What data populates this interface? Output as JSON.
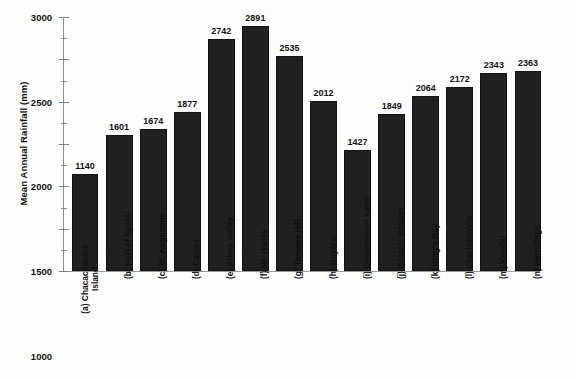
{
  "chart_data": {
    "type": "bar",
    "title": "",
    "xlabel": "",
    "ylabel": "Mean Annual Rainfall (mm)",
    "ylim": [
      0,
      3000
    ],
    "ytick_step": 500,
    "yminor_step": 250,
    "grid": false,
    "legend": "none",
    "yticks": [
      "0",
      "500",
      "1000",
      "1500",
      "2000",
      "2500",
      "3000"
    ],
    "categories": [
      "(a) Chacachacare Island",
      "(b) Port of Spain",
      "(c) St. Augustine",
      "(d) Caroni",
      "(e) Arima Valley",
      "(f) Mt. Harris",
      "(g) Tamana Hill",
      "(h) Mayaro",
      "(i) Government Farm",
      "(j) Botanic Station",
      "(k) King's Bay",
      "(l) Charlotteville",
      "(m) Kendal",
      "(n) Hermitage"
    ],
    "category_lines": [
      [
        "(a) Chacachacare",
        "Island"
      ],
      [
        "(b) Port of Spain"
      ],
      [
        "(c) St. Augustine"
      ],
      [
        "(d) Caroni"
      ],
      [
        "(e) Arima Valley"
      ],
      [
        "(f) Mt. Harris"
      ],
      [
        "(g) Tamana Hill"
      ],
      [
        "(h) Mayaro"
      ],
      [
        "(i) Government Farm"
      ],
      [
        "(j) Botanic Station"
      ],
      [
        "(k) King's Bay"
      ],
      [
        "(l) Charlotteville"
      ],
      [
        "(m) Kendal"
      ],
      [
        "(n) Hermitage"
      ]
    ],
    "values": [
      1140,
      1601,
      1674,
      1877,
      2742,
      2891,
      2535,
      2012,
      1427,
      1849,
      2064,
      2172,
      2343,
      2363
    ],
    "value_labels": [
      "1140",
      "1601",
      "1674",
      "1877",
      "2742",
      "2891",
      "2535",
      "2012",
      "1427",
      "1849",
      "2064",
      "2172",
      "2343",
      "2363"
    ],
    "bar_color": "#191919",
    "axis_color": "#8e8e8e",
    "text_color": "#111111",
    "background_color": "#fdfdfd"
  }
}
